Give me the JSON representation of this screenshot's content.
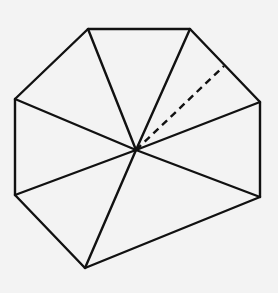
{
  "diagram": {
    "background": "#f3f3f3",
    "stroke_color": "#111111",
    "stroke_width": 2.4,
    "center": {
      "name": "O",
      "x": 136,
      "y": 150
    },
    "vertices": [
      {
        "name": "A",
        "x": 88,
        "y": 29
      },
      {
        "name": "B",
        "x": 190,
        "y": 29
      },
      {
        "name": "C",
        "x": 260,
        "y": 102
      },
      {
        "name": "D",
        "x": 260,
        "y": 197
      },
      {
        "name": "E",
        "x": 85,
        "y": 268
      },
      {
        "name": "F",
        "x": 15,
        "y": 195
      },
      {
        "name": "G",
        "x": 15,
        "y": 99
      }
    ],
    "dashed_segment": {
      "from": {
        "x": 136,
        "y": 150
      },
      "to": {
        "x": 224,
        "y": 66
      },
      "dash": "7 5",
      "note": "dashed line from interior point to edge BC"
    }
  }
}
